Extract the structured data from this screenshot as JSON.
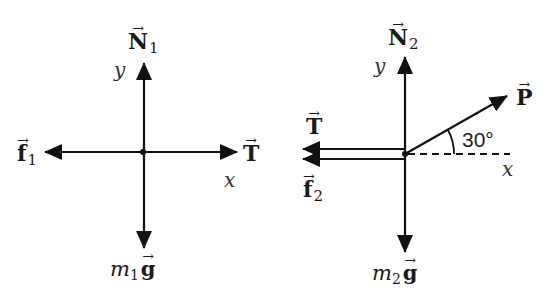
{
  "diagrams": [
    {
      "id": "block-1",
      "origin": [
        143,
        152
      ],
      "axes": {
        "x_label": "x",
        "y_label": "y"
      },
      "forces": [
        {
          "name": "normal",
          "symbol": "N",
          "subscript": "1",
          "direction": "up"
        },
        {
          "name": "friction",
          "symbol": "f",
          "subscript": "1",
          "direction": "left"
        },
        {
          "name": "tension",
          "symbol": "T",
          "subscript": "",
          "direction": "right"
        },
        {
          "name": "weight",
          "mass_symbol": "m",
          "subscript": "1",
          "vector": "g",
          "direction": "down"
        }
      ]
    },
    {
      "id": "block-2",
      "origin": [
        405,
        154
      ],
      "axes": {
        "x_label": "x",
        "y_label": "y"
      },
      "angle_label": "30°",
      "forces": [
        {
          "name": "normal",
          "symbol": "N",
          "subscript": "2",
          "direction": "up"
        },
        {
          "name": "tension",
          "symbol": "T",
          "subscript": "",
          "direction": "left"
        },
        {
          "name": "friction",
          "symbol": "f",
          "subscript": "2",
          "direction": "left"
        },
        {
          "name": "applied",
          "symbol": "P",
          "subscript": "",
          "direction": "30° above +x"
        },
        {
          "name": "weight",
          "mass_symbol": "m",
          "subscript": "2",
          "vector": "g",
          "direction": "down"
        }
      ]
    }
  ],
  "colors": {
    "ink": "#111111",
    "background": "#ffffff"
  },
  "vector_arrow_glyph": "→"
}
